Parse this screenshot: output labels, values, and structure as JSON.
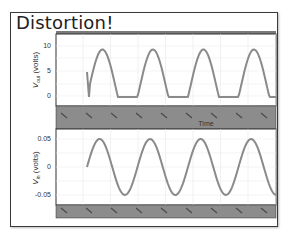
{
  "slide": {
    "title": "Distortion!"
  },
  "colors": {
    "trace": "#8a8a8a",
    "band": "#8c8c8c",
    "grid": "#e6e6e6",
    "axis": "#333333"
  },
  "chart_data": [
    {
      "type": "line",
      "title": "",
      "xlabel": "Time",
      "ylabel": "V_out (volts)",
      "ylabel_main": "V",
      "ylabel_sub": "out",
      "ylabel_rest": " (volts)",
      "yticks": [
        "0",
        "5",
        "10"
      ],
      "ylim": [
        -1,
        11
      ],
      "grid": true,
      "description": "Distorted (clipped) output: half-wave-like waveform with flat bottoms at 0 V and peaks near 9.5 V, ~3.5 periods",
      "series": [
        {
          "name": "V_out",
          "x": [
            0,
            0.1,
            0.2,
            0.3,
            0.4,
            0.5,
            0.6,
            0.7,
            0.8,
            0.9,
            1.0,
            1.1,
            1.2,
            1.3,
            1.4,
            1.5,
            1.6,
            1.7,
            1.8,
            1.9,
            2.0,
            2.1,
            2.2,
            2.3,
            2.4,
            2.5,
            2.6,
            2.7,
            2.8,
            2.9,
            3.0,
            3.1,
            3.2,
            3.3,
            3.4,
            3.5
          ],
          "values": [
            5,
            0,
            0,
            0,
            4.8,
            8.5,
            9.5,
            8.5,
            4.8,
            0,
            0,
            0,
            4.8,
            8.5,
            9.5,
            8.5,
            4.8,
            0,
            0,
            0,
            4.8,
            8.5,
            9.5,
            8.5,
            4.8,
            0,
            0,
            0,
            4.8,
            8.5,
            9.5,
            9.5,
            9.5,
            9.5,
            9.5,
            9.5
          ]
        }
      ]
    },
    {
      "type": "line",
      "title": "",
      "xlabel": "",
      "ylabel": "V_in (volts)",
      "ylabel_main": "V",
      "ylabel_sub": "in",
      "ylabel_rest": " (volts)",
      "yticks": [
        "-0.05",
        "0",
        "0.05"
      ],
      "ylim": [
        -0.06,
        0.06
      ],
      "grid": true,
      "description": "Input sinusoid, amplitude 0.05 V, ~3.8 periods",
      "series": [
        {
          "name": "V_in",
          "x": [
            0,
            0.25,
            0.5,
            0.75,
            1,
            1.25,
            1.5,
            1.75,
            2,
            2.25,
            2.5,
            2.75,
            3,
            3.25,
            3.5,
            3.75
          ],
          "values": [
            0,
            0.05,
            0,
            -0.05,
            0,
            0.05,
            0,
            -0.05,
            0,
            0.05,
            0,
            -0.05,
            0,
            0.05,
            0,
            -0.05
          ]
        }
      ]
    }
  ]
}
